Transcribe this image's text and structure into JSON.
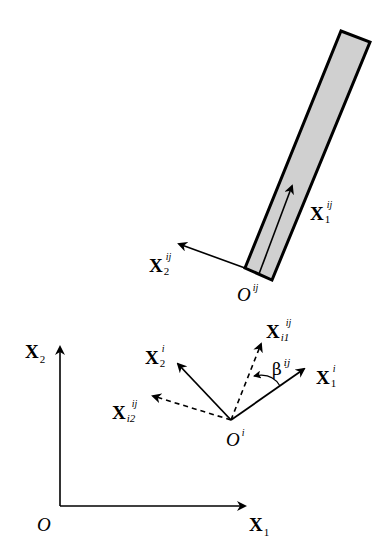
{
  "diagram": {
    "title": "",
    "colors": {
      "stroke": "#000000",
      "bar_fill": "#d0d0d0",
      "background": "#ffffff"
    },
    "global_frame": {
      "origin_label": "O",
      "x1": {
        "base": "X",
        "sub": "1"
      },
      "x2": {
        "base": "X",
        "sub": "2"
      }
    },
    "body_frame": {
      "origin": {
        "base": "O",
        "sup": "ij"
      },
      "x1": {
        "base": "X",
        "sub": "1",
        "sup": "ij"
      },
      "x2": {
        "base": "X",
        "sub": "2",
        "sup": "ij"
      }
    },
    "joint_frame": {
      "origin": {
        "base": "O",
        "sup": "i"
      },
      "x1": {
        "base": "X",
        "sub": "1",
        "sup": "i"
      },
      "x2": {
        "base": "X",
        "sub": "2",
        "sup": "i"
      },
      "xi1": {
        "base": "X",
        "sub": "i1",
        "sup": "ij"
      },
      "xi2": {
        "base": "X",
        "sub": "i2",
        "sup": "ij"
      },
      "angle": {
        "base": "β",
        "sup": "ij"
      }
    }
  }
}
